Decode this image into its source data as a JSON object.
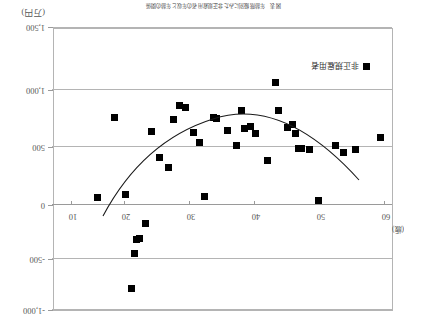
{
  "chart_data": {
    "type": "scatter",
    "title": "図表　年齢階級別にみた非正規雇用者の年収と年齢の関係",
    "xlabel": "(歳)",
    "ylabel": "(万円)",
    "xlim": [
      65,
      5
    ],
    "ylim": [
      -1000,
      1500
    ],
    "x_ticks": [
      60,
      50,
      40,
      30,
      20,
      10
    ],
    "y_ticks": [
      -1000,
      -500,
      0,
      500,
      1000,
      1500
    ],
    "y_tick_labels": [
      "-1,000",
      "-500",
      "0",
      "500",
      "1,000",
      "1,500"
    ],
    "grid": true,
    "legend_position": "bottom-left",
    "series": [
      {
        "name": "非正規雇用者",
        "marker": "square",
        "color": "#000000",
        "points": [
          {
            "x": 63.0,
            "y": 525
          },
          {
            "x": 58.5,
            "y": 420
          },
          {
            "x": 56.5,
            "y": 390
          },
          {
            "x": 55.0,
            "y": 450
          },
          {
            "x": 52.0,
            "y": -30
          },
          {
            "x": 50.5,
            "y": 420
          },
          {
            "x": 49.0,
            "y": 430
          },
          {
            "x": 48.5,
            "y": 430
          },
          {
            "x": 48.0,
            "y": 560
          },
          {
            "x": 47.5,
            "y": 640
          },
          {
            "x": 46.5,
            "y": 610
          },
          {
            "x": 45.0,
            "y": 760
          },
          {
            "x": 44.5,
            "y": 1010
          },
          {
            "x": 43.0,
            "y": 325
          },
          {
            "x": 41.0,
            "y": 560
          },
          {
            "x": 40.0,
            "y": 620
          },
          {
            "x": 39.0,
            "y": 600
          },
          {
            "x": 38.5,
            "y": 760
          },
          {
            "x": 37.5,
            "y": 450
          },
          {
            "x": 36.0,
            "y": 590
          },
          {
            "x": 34.0,
            "y": 690
          },
          {
            "x": 33.5,
            "y": 700
          },
          {
            "x": 32.0,
            "y": 0
          },
          {
            "x": 31.0,
            "y": 480
          },
          {
            "x": 30.0,
            "y": 570
          },
          {
            "x": 28.5,
            "y": 790
          },
          {
            "x": 27.5,
            "y": 810
          },
          {
            "x": 26.5,
            "y": 680
          },
          {
            "x": 25.5,
            "y": 260
          },
          {
            "x": 24.0,
            "y": 350
          },
          {
            "x": 22.5,
            "y": 575
          },
          {
            "x": 21.5,
            "y": -240
          },
          {
            "x": 20.5,
            "y": -370
          },
          {
            "x": 20.0,
            "y": -375
          },
          {
            "x": 19.5,
            "y": -505
          },
          {
            "x": 19.0,
            "y": -810
          },
          {
            "x": 18.0,
            "y": 20
          },
          {
            "x": 16.0,
            "y": 700
          },
          {
            "x": 13.0,
            "y": -10
          }
        ]
      }
    ],
    "trendline": {
      "type": "quadratic",
      "description": "fitted U-shaped curve with minimum near age 36"
    }
  },
  "legend": {
    "label": "非正規雇用者"
  }
}
